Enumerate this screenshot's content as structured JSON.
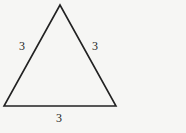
{
  "diagram": {
    "type": "equilateral-triangle",
    "stroke_color": "#222222",
    "background_color": "#f6f6f4",
    "vertices": {
      "apex": [
        60,
        5
      ],
      "bottom_left": [
        4,
        106
      ],
      "bottom_right": [
        116,
        106
      ]
    },
    "side_labels": {
      "left": "3",
      "right": "3",
      "bottom": "3"
    }
  }
}
